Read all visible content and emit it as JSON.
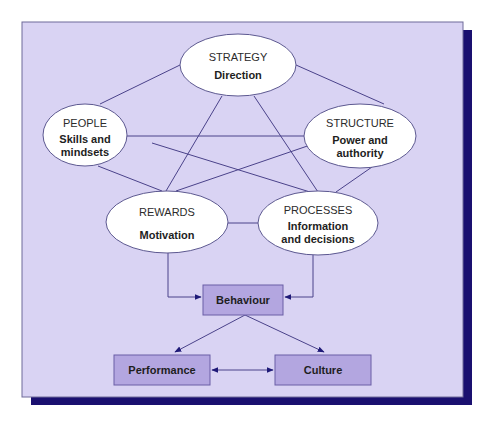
{
  "diagram": {
    "colors": {
      "panel_fill": "#d9d3f3",
      "panel_border": "#6e6a99",
      "shadow": "#1a1070",
      "ellipse_fill": "#ffffff",
      "ellipse_stroke": "#5c5890",
      "line": "#4a428a",
      "box_fill": "#b3a6e0",
      "box_stroke": "#6a5ea6",
      "arrow": "#1f1a78"
    },
    "nodes": {
      "strategy": {
        "title": "STRATEGY",
        "subtitle_lines": [
          "Direction"
        ]
      },
      "people": {
        "title": "PEOPLE",
        "subtitle_lines": [
          "Skills and",
          "mindsets"
        ]
      },
      "structure": {
        "title": "STRUCTURE",
        "subtitle_lines": [
          "Power and",
          "authority"
        ]
      },
      "rewards": {
        "title": "REWARDS",
        "subtitle_lines": [
          "Motivation"
        ]
      },
      "processes": {
        "title": "PROCESSES",
        "subtitle_lines": [
          "Information",
          "and decisions"
        ]
      }
    },
    "boxes": {
      "behaviour": {
        "label": "Behaviour"
      },
      "performance": {
        "label": "Performance"
      },
      "culture": {
        "label": "Culture"
      }
    },
    "connections": [
      {
        "from": "strategy",
        "to": "people",
        "type": "line"
      },
      {
        "from": "strategy",
        "to": "structure",
        "type": "line"
      },
      {
        "from": "strategy",
        "to": "rewards",
        "type": "line"
      },
      {
        "from": "strategy",
        "to": "processes",
        "type": "line"
      },
      {
        "from": "people",
        "to": "structure",
        "type": "line"
      },
      {
        "from": "people",
        "to": "processes",
        "type": "line"
      },
      {
        "from": "people",
        "to": "rewards",
        "type": "line"
      },
      {
        "from": "structure",
        "to": "rewards",
        "type": "line"
      },
      {
        "from": "structure",
        "to": "processes",
        "type": "line"
      },
      {
        "from": "rewards",
        "to": "processes",
        "type": "line"
      },
      {
        "from": "rewards",
        "to": "behaviour",
        "type": "arrow"
      },
      {
        "from": "processes",
        "to": "behaviour",
        "type": "arrow"
      },
      {
        "from": "behaviour",
        "to": "performance",
        "type": "arrow"
      },
      {
        "from": "behaviour",
        "to": "culture",
        "type": "arrow"
      },
      {
        "from": "performance",
        "to": "culture",
        "type": "double-arrow"
      }
    ]
  }
}
